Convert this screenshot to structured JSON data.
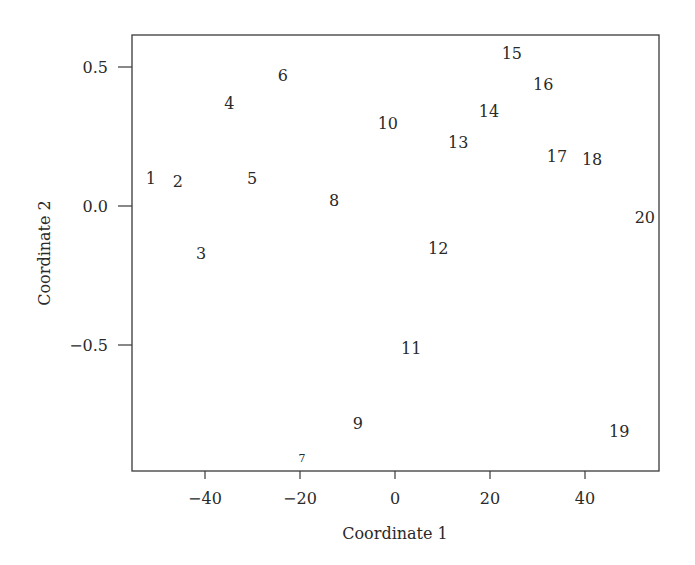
{
  "chart_data": {
    "type": "scatter",
    "title": "",
    "xlabel": "Coordinate 1",
    "ylabel": "Coordinate 2",
    "xlim": [
      -55,
      55
    ],
    "ylim": [
      -0.96,
      0.62
    ],
    "grid": false,
    "legend": null,
    "x_ticks": [
      -40,
      -20,
      0,
      20,
      40
    ],
    "x_tick_labels": [
      "−40",
      "−20",
      "0",
      "20",
      "40"
    ],
    "y_ticks": [
      0.5,
      0.0,
      -0.5
    ],
    "y_tick_labels": [
      "0.5",
      "0.0",
      "−0.5"
    ],
    "marker": "text-label",
    "points": [
      {
        "label": "1",
        "x": -51.4,
        "y": 0.1
      },
      {
        "label": "2",
        "x": -45.7,
        "y": 0.09
      },
      {
        "label": "3",
        "x": -40.8,
        "y": -0.17
      },
      {
        "label": "4",
        "x": -34.9,
        "y": 0.37
      },
      {
        "label": "5",
        "x": -30.1,
        "y": 0.1
      },
      {
        "label": "6",
        "x": -23.6,
        "y": 0.47
      },
      {
        "label": "7",
        "x": -19.6,
        "y": -0.9,
        "small": true
      },
      {
        "label": "8",
        "x": -12.8,
        "y": 0.02
      },
      {
        "label": "9",
        "x": -7.8,
        "y": -0.78
      },
      {
        "label": "10",
        "x": -1.5,
        "y": 0.3
      },
      {
        "label": "11",
        "x": 3.4,
        "y": -0.51
      },
      {
        "label": "12",
        "x": 9.1,
        "y": -0.15
      },
      {
        "label": "13",
        "x": 13.3,
        "y": 0.23
      },
      {
        "label": "14",
        "x": 19.8,
        "y": 0.34
      },
      {
        "label": "15",
        "x": 24.6,
        "y": 0.55
      },
      {
        "label": "16",
        "x": 31.2,
        "y": 0.44
      },
      {
        "label": "17",
        "x": 34.1,
        "y": 0.18
      },
      {
        "label": "18",
        "x": 41.5,
        "y": 0.17
      },
      {
        "label": "19",
        "x": 47.2,
        "y": -0.81
      },
      {
        "label": "20",
        "x": 52.6,
        "y": -0.04
      }
    ]
  },
  "colors": {
    "axis": "#3a3a3a",
    "text": "#2a2a2a",
    "background": "#ffffff"
  }
}
